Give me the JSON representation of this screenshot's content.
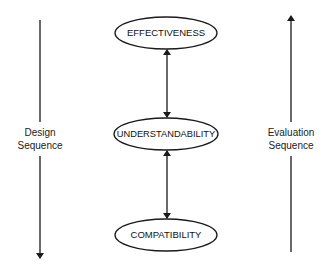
{
  "diagram": {
    "nodes": [
      {
        "id": "effectiveness",
        "label": "EFFECTIVENESS"
      },
      {
        "id": "understandability",
        "label": "UNDERSTANDABILITY"
      },
      {
        "id": "compatibility",
        "label": "COMPATIBILITY"
      }
    ],
    "edges": [
      {
        "from": "effectiveness",
        "to": "understandability",
        "type": "bidirectional"
      },
      {
        "from": "understandability",
        "to": "compatibility",
        "type": "bidirectional"
      }
    ],
    "left_axis": {
      "line1": "Design",
      "line2": "Sequence",
      "direction": "down"
    },
    "right_axis": {
      "line1": "Evaluation",
      "line2": "Sequence",
      "direction": "up"
    },
    "colors": {
      "stroke": "#1a1a1a",
      "background": "#ffffff"
    }
  }
}
